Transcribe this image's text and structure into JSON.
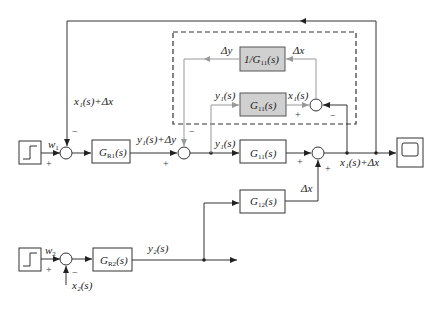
{
  "diagram": {
    "type": "control-block-diagram",
    "blocks": {
      "step1": {
        "label": "step-input-1"
      },
      "gr1": {
        "label": "G",
        "sub": "R1",
        "arg": "(s)"
      },
      "g11_main": {
        "label": "G",
        "sub": "11",
        "arg": "(s)"
      },
      "g11_model": {
        "label": "G",
        "sub": "11",
        "arg": "(s)"
      },
      "inv_g11": {
        "label": "1/G",
        "sub": "11",
        "arg": "(s)"
      },
      "g12": {
        "label": "G",
        "sub": "12",
        "arg": "(s)"
      },
      "step2": {
        "label": "step-input-2"
      },
      "gr2": {
        "label": "G",
        "sub": "R2",
        "arg": "(s)"
      },
      "scope": {
        "label": "scope"
      }
    },
    "signals": {
      "w1": "w",
      "w1_sub": "1",
      "w2": "w",
      "w2_sub": "2",
      "feedback_top": "x₁(s)+Δx",
      "gr1_out": "y₁(s)+Δy",
      "y1_main": "y₁(s)",
      "y1_model": "y₁(s)",
      "x1_model": "x₁(s)",
      "delta_y": "Δy",
      "delta_x_top": "Δx",
      "output": "x₁(s)+Δx",
      "delta_x_g12": "Δx",
      "y2": "y₂(s)",
      "x2": "x₂(s)"
    },
    "signs": {
      "sum1_top": "−",
      "sum1_left": "+",
      "sum2_top": "−",
      "sum2_left": "+",
      "sum3_left": "+",
      "sum3_bottom": "+",
      "inner_left": "+",
      "inner_right": "−",
      "sumb_left": "+",
      "sumb_bottom": "−"
    },
    "colors": {
      "main_line": "#333333",
      "model_line": "#999999",
      "model_block_fill": "#d0d0d0"
    }
  }
}
